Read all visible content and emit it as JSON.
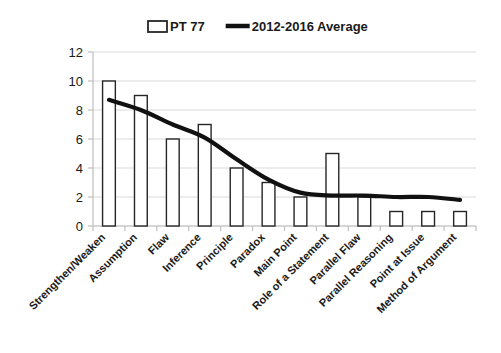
{
  "chart_data": {
    "type": "bar",
    "title": "",
    "subtitle": "",
    "xlabel": "",
    "ylabel": "",
    "ylim": [
      0,
      12
    ],
    "ytick_step": 2,
    "yticks": [
      "0",
      "2",
      "4",
      "6",
      "8",
      "10",
      "12"
    ],
    "grid": true,
    "legend_position": "top-center",
    "categories": [
      "Strengthen/Weaken",
      "Assumption",
      "Flaw",
      "Inference",
      "Principle",
      "Paradox",
      "Main Point",
      "Role of a Statement",
      "Parallel Flaw",
      "Parallel Reasoning",
      "Point at Issue",
      "Method of Argument"
    ],
    "series": [
      {
        "name": "PT 77",
        "type": "bar",
        "values": [
          10,
          9,
          6,
          7,
          4,
          3,
          2,
          5,
          2,
          1,
          1,
          1
        ]
      },
      {
        "name": "2012-2016 Average",
        "type": "line",
        "values": [
          8.7,
          8.0,
          7.0,
          6.1,
          4.6,
          3.2,
          2.3,
          2.1,
          2.1,
          2.0,
          2.0,
          1.8
        ]
      }
    ]
  },
  "legend": {
    "items": [
      {
        "label": "PT 77",
        "marker": "open-rect-swatch",
        "color": "#ffffff"
      },
      {
        "label": "2012-2016 Average",
        "marker": "thick-line-swatch",
        "color": "#111111"
      }
    ]
  },
  "colors": {
    "bar_stroke": "#262626",
    "bar_fill": "#ffffff",
    "line": "#111111",
    "gridline": "#d9d9d9",
    "axis": "#bfbfbf",
    "text": "#1a1a1a",
    "background": "#ffffff"
  }
}
